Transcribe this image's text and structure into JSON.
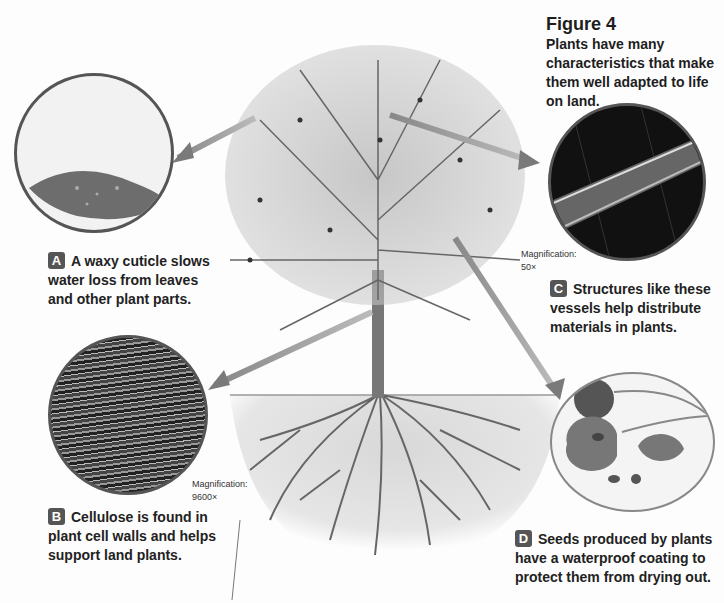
{
  "figure": {
    "title": "Figure 4",
    "caption": "Plants have many characteristics that make them well adapted to life on land."
  },
  "callouts": [
    {
      "letter": "A",
      "text": "A waxy cuticle slows water loss from leaves and other plant parts.",
      "image": "leaf with water droplets"
    },
    {
      "letter": "B",
      "text": "Cellulose is found in plant cell walls and helps support land plants.",
      "image": "cellulose micrograph",
      "magnification_label": "Magnification:",
      "magnification_value": "9600×"
    },
    {
      "letter": "C",
      "text": "Structures like these vessels help distribute materials in plants.",
      "image": "vessel micrograph",
      "magnification_label": "Magnification:",
      "magnification_value": "50×"
    },
    {
      "letter": "D",
      "text": "Seeds produced by plants have a waterproof coating to protect them from drying out.",
      "image": "cherries cut open with seeds"
    }
  ],
  "illustration": {
    "subject": "tree with roots in soil"
  },
  "colors": {
    "badge": "#555555",
    "arrow": "#777777",
    "circle_border": "#555555"
  }
}
